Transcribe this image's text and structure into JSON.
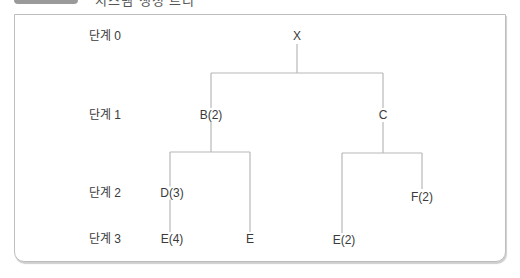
{
  "header": {
    "title": "시스템 생성 트리"
  },
  "levels": [
    {
      "label": "단계 0",
      "y": 36
    },
    {
      "label": "단계 1",
      "y": 115
    },
    {
      "label": "단계 2",
      "y": 193
    },
    {
      "label": "단계 3",
      "y": 239
    }
  ],
  "nodes": {
    "X": {
      "label": "X",
      "x": 297,
      "y": 36
    },
    "B": {
      "label": "B(2)",
      "x": 211,
      "y": 115
    },
    "C": {
      "label": "C",
      "x": 383,
      "y": 115
    },
    "D": {
      "label": "D(3)",
      "x": 170,
      "y": 193
    },
    "E4": {
      "label": "E(4)",
      "x": 170,
      "y": 239
    },
    "E": {
      "label": "E",
      "x": 250,
      "y": 239
    },
    "E2": {
      "label": "E(2)",
      "x": 342,
      "y": 240
    },
    "F": {
      "label": "F(2)",
      "x": 422,
      "y": 197
    }
  },
  "edges": [
    {
      "from": "X",
      "to": "B"
    },
    {
      "from": "X",
      "to": "C"
    },
    {
      "from": "B",
      "to": "D"
    },
    {
      "from": "D",
      "to": "E4"
    },
    {
      "from": "B",
      "to": "E"
    },
    {
      "from": "C",
      "to": "E2"
    },
    {
      "from": "C",
      "to": "F"
    }
  ],
  "colors": {
    "line": "#b8b8b8",
    "text": "#3a3a3a",
    "border": "#bdbdbd"
  }
}
